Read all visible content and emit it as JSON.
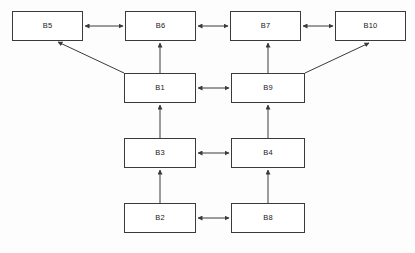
{
  "diagram": {
    "type": "block-diagram",
    "title": "",
    "background_color": "#fdfdfd",
    "node_border_color": "#3a3a3a",
    "node_fill_color": "#ffffff",
    "edge_color": "#3a3a3a",
    "nodes": [
      {
        "id": "B5",
        "label": "B5",
        "x": 12,
        "y": 11,
        "w": 71,
        "h": 30
      },
      {
        "id": "B6",
        "label": "B6",
        "x": 125,
        "y": 11,
        "w": 71,
        "h": 30
      },
      {
        "id": "B7",
        "label": "B7",
        "x": 230,
        "y": 11,
        "w": 71,
        "h": 30
      },
      {
        "id": "B10",
        "label": "B10",
        "x": 335,
        "y": 11,
        "w": 71,
        "h": 30
      },
      {
        "id": "B1",
        "label": "B1",
        "x": 124,
        "y": 73,
        "w": 72,
        "h": 30
      },
      {
        "id": "B9",
        "label": "B9",
        "x": 231,
        "y": 73,
        "w": 74,
        "h": 30
      },
      {
        "id": "B3",
        "label": "B3",
        "x": 124,
        "y": 138,
        "w": 72,
        "h": 30
      },
      {
        "id": "B4",
        "label": "B4",
        "x": 231,
        "y": 138,
        "w": 74,
        "h": 30
      },
      {
        "id": "B2",
        "label": "B2",
        "x": 124,
        "y": 203,
        "w": 72,
        "h": 30
      },
      {
        "id": "B8",
        "label": "B8",
        "x": 231,
        "y": 203,
        "w": 74,
        "h": 30
      }
    ],
    "edges": [
      {
        "from": "B5",
        "to": "B6",
        "style": "double-arrow",
        "orientation": "horizontal"
      },
      {
        "from": "B6",
        "to": "B7",
        "style": "double-arrow",
        "orientation": "horizontal"
      },
      {
        "from": "B7",
        "to": "B10",
        "style": "double-arrow",
        "orientation": "horizontal"
      },
      {
        "from": "B1",
        "to": "B5",
        "style": "single-arrow",
        "orientation": "diagonal"
      },
      {
        "from": "B1",
        "to": "B6",
        "style": "single-arrow",
        "orientation": "vertical"
      },
      {
        "from": "B9",
        "to": "B7",
        "style": "single-arrow",
        "orientation": "vertical"
      },
      {
        "from": "B9",
        "to": "B10",
        "style": "single-arrow",
        "orientation": "diagonal"
      },
      {
        "from": "B1",
        "to": "B9",
        "style": "double-arrow",
        "orientation": "horizontal"
      },
      {
        "from": "B3",
        "to": "B1",
        "style": "single-arrow",
        "orientation": "vertical"
      },
      {
        "from": "B4",
        "to": "B9",
        "style": "single-arrow",
        "orientation": "vertical"
      },
      {
        "from": "B3",
        "to": "B4",
        "style": "double-arrow",
        "orientation": "horizontal"
      },
      {
        "from": "B2",
        "to": "B3",
        "style": "single-arrow",
        "orientation": "vertical"
      },
      {
        "from": "B8",
        "to": "B4",
        "style": "single-arrow",
        "orientation": "vertical"
      },
      {
        "from": "B2",
        "to": "B8",
        "style": "double-arrow",
        "orientation": "horizontal"
      }
    ]
  }
}
